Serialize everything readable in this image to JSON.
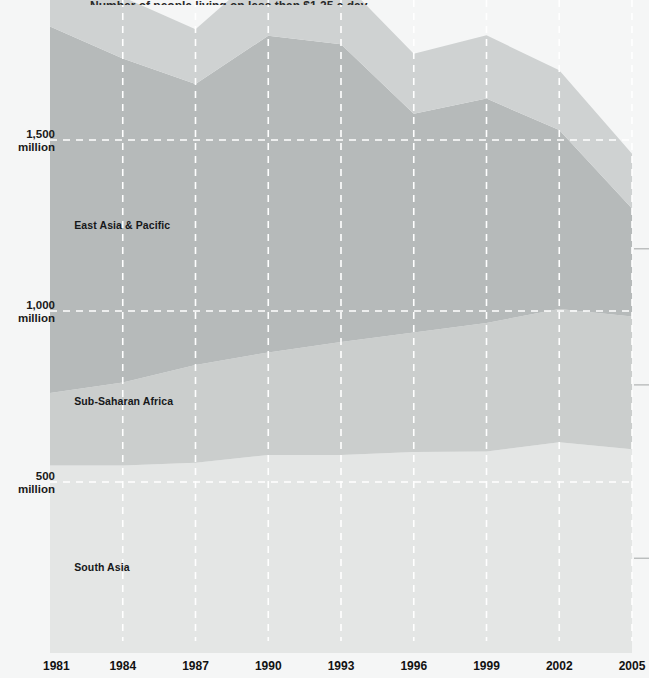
{
  "chart_data": {
    "type": "area",
    "stacked": true,
    "title": "Number of people living on less than $1.25 a day",
    "title_clipped": true,
    "xlabel": "",
    "ylabel": "",
    "x": [
      1981,
      1984,
      1987,
      1990,
      1993,
      1996,
      1999,
      2002,
      2005
    ],
    "xtick_labels": [
      "1981",
      "1984",
      "1987",
      "1990",
      "1993",
      "1996",
      "1999",
      "2002",
      "2005"
    ],
    "ytick_values": [
      500,
      1000,
      1500
    ],
    "ytick_labels": [
      "500\nmillion",
      "1,000\nmillion",
      "1,500\nmillion"
    ],
    "ylim": [
      0,
      2100
    ],
    "xlim": [
      1981,
      2005
    ],
    "unit": "million people",
    "grid": true,
    "grid_style": "dashed-white",
    "legend_position": "inline-on-bands",
    "series": [
      {
        "name": "South Asia",
        "label": "South Asia",
        "color": "#e4e6e5",
        "label_x": 1982.0,
        "label_y": 240,
        "values": [
          548,
          548,
          556,
          579,
          579,
          588,
          589,
          616,
          596
        ]
      },
      {
        "name": "Sub-Saharan Africa",
        "label": "Sub-Saharan Africa",
        "color": "#cbcecd",
        "label_x": 1982.0,
        "label_y": 725,
        "values": [
          212,
          243,
          286,
          300,
          330,
          349,
          376,
          390,
          388
        ]
      },
      {
        "name": "East Asia & Pacific",
        "label": "East Asia & Pacific",
        "color": "#b6baba",
        "label_x": 1982.0,
        "label_y": 1240,
        "values": [
          1072,
          947,
          822,
          926,
          871,
          640,
          656,
          523,
          316
        ]
      },
      {
        "name": "Other regions",
        "label": "",
        "color": "#cfd2d2",
        "label_x": null,
        "label_y": null,
        "values": [
          210,
          180,
          160,
          205,
          190,
          175,
          185,
          175,
          160
        ]
      }
    ],
    "callouts": [
      {
        "label": "",
        "y_value": 1182
      },
      {
        "label": "",
        "y_value": 784
      },
      {
        "label": "",
        "y_value": 277
      }
    ]
  },
  "axis": {
    "ytick_0_line1": "500",
    "ytick_0_line2": "million",
    "ytick_1_line1": "1,000",
    "ytick_1_line2": "million",
    "ytick_2_line1": "1,500",
    "ytick_2_line2": "million"
  },
  "colors": {
    "background": "#f5f6f6",
    "grid": "#ffffff",
    "text": "#141414",
    "band_south_asia": "#e4e6e5",
    "band_sub_saharan": "#cbcecd",
    "band_east_asia": "#b6baba",
    "band_other": "#cfd2d2"
  }
}
